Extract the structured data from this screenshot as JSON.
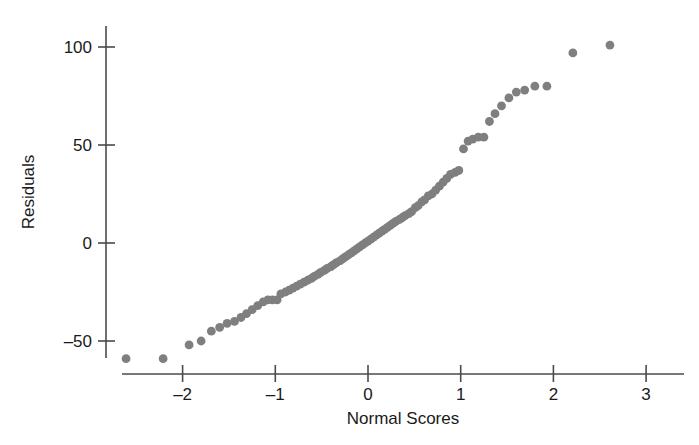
{
  "figure": {
    "title": "",
    "background_color": "#ffffff",
    "point_color": "#7f7f7f",
    "axis_color": "#4a4a4a",
    "text_color": "#1a1a1a"
  },
  "axes": {
    "x_title": "Normal Scores",
    "y_title": "Residuals",
    "x_ticks": [
      "-2",
      "-1",
      "0",
      "1",
      "2",
      "3"
    ],
    "x_tick_values": [
      -2,
      -1,
      0,
      1,
      2,
      3
    ],
    "y_ticks": [
      "-50",
      "0",
      "50",
      "100"
    ],
    "y_tick_values": [
      -50,
      0,
      50,
      100
    ]
  },
  "chart_data": {
    "type": "scatter",
    "title": "",
    "subtitle": "",
    "xlabel": "Normal Scores",
    "ylabel": "Residuals",
    "xlim": [
      -2.75,
      3.25
    ],
    "ylim": [
      -68,
      112
    ],
    "x_ticks": [
      -2,
      -1,
      0,
      1,
      2,
      3
    ],
    "y_ticks": [
      -50,
      0,
      50,
      100
    ],
    "grid": false,
    "legend": null,
    "marker": "circle",
    "marker_color": "#7f7f7f",
    "marker_size": 8,
    "series": [
      {
        "name": "Residuals vs Normal Scores",
        "x": [
          -2.61,
          -2.21,
          -1.93,
          -1.8,
          -1.69,
          -1.6,
          -1.52,
          -1.44,
          -1.37,
          -1.31,
          -1.25,
          -1.19,
          -1.13,
          -1.08,
          -1.03,
          -0.98,
          -0.94,
          -0.89,
          -0.85,
          -0.81,
          -0.77,
          -0.73,
          -0.69,
          -0.65,
          -0.61,
          -0.58,
          -0.54,
          -0.51,
          -0.47,
          -0.44,
          -0.4,
          -0.37,
          -0.34,
          -0.3,
          -0.27,
          -0.24,
          -0.21,
          -0.18,
          -0.15,
          -0.12,
          -0.09,
          -0.06,
          -0.03,
          0.0,
          0.03,
          0.06,
          0.09,
          0.12,
          0.15,
          0.18,
          0.21,
          0.24,
          0.27,
          0.3,
          0.34,
          0.37,
          0.4,
          0.44,
          0.47,
          0.51,
          0.54,
          0.58,
          0.61,
          0.65,
          0.69,
          0.73,
          0.77,
          0.81,
          0.85,
          0.89,
          0.94,
          0.98,
          1.03,
          1.08,
          1.13,
          1.19,
          1.25,
          1.31,
          1.37,
          1.44,
          1.52,
          1.6,
          1.69,
          1.8,
          1.93,
          2.21,
          2.61
        ],
        "y": [
          -59,
          -59,
          -52,
          -50,
          -45,
          -43,
          -41,
          -40,
          -38,
          -36,
          -34,
          -32,
          -30,
          -29,
          -29,
          -29,
          -26,
          -25,
          -24,
          -23,
          -22,
          -21,
          -20,
          -19,
          -18,
          -17,
          -16,
          -15,
          -14,
          -13,
          -12,
          -11,
          -10,
          -9,
          -8,
          -7,
          -6,
          -5,
          -4,
          -3,
          -2,
          -1,
          0,
          1,
          2,
          3,
          4,
          5,
          6,
          7,
          8,
          9,
          10,
          11,
          12,
          13,
          14,
          15,
          16,
          18,
          19,
          21,
          22,
          24,
          25,
          27,
          29,
          31,
          33,
          35,
          36,
          37,
          48,
          52,
          53,
          54,
          54,
          62,
          66,
          70,
          74,
          77,
          78,
          80,
          80,
          97,
          101
        ]
      }
    ]
  }
}
